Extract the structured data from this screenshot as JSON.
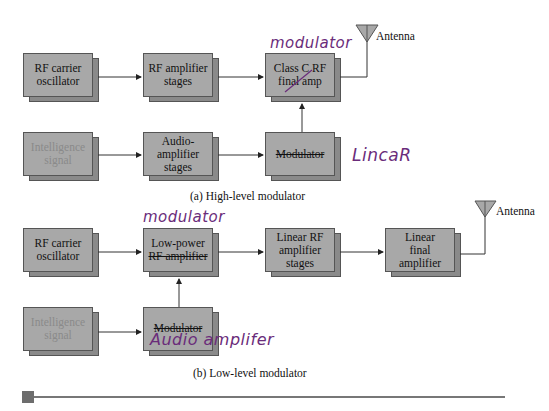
{
  "diagram_a": {
    "caption": "(a) High-level modulator",
    "blocks": [
      {
        "id": "rf_carrier_oscillator",
        "line1": "RF carrier",
        "line2": "oscillator"
      },
      {
        "id": "rf_amplifier_stages",
        "line1": "RF amplifier",
        "line2": "stages"
      },
      {
        "id": "class_c_final_amp",
        "line1": "Class C RF",
        "line2": "final amp",
        "struck": true
      },
      {
        "id": "intelligence_signal",
        "line1": "Intelligence",
        "line2": "signal",
        "faded": true
      },
      {
        "id": "audio_amplifier_stages",
        "line1": "Audio-",
        "line2": "amplifier",
        "line3": "stages"
      },
      {
        "id": "modulator",
        "line1": "Modulator",
        "struck": true
      }
    ],
    "antenna_label": "Antenna",
    "handwritten": {
      "above_final_amp": "modulator",
      "beside_modulator": "LincaR"
    }
  },
  "diagram_b": {
    "caption": "(b) Low-level modulator",
    "blocks": [
      {
        "id": "rf_carrier_oscillator",
        "line1": "RF carrier",
        "line2": "oscillator"
      },
      {
        "id": "low_power_rf_amplifier",
        "line1": "Low-power",
        "line2": "RF amplifier",
        "struck": true
      },
      {
        "id": "linear_rf_amplifier_stages",
        "line1": "Linear RF",
        "line2": "amplifier",
        "line3": "stages"
      },
      {
        "id": "linear_final_amplifier",
        "line1": "Linear",
        "line2": "final",
        "line3": "amplifier"
      },
      {
        "id": "intelligence_signal",
        "line1": "Intelligence",
        "line2": "signal",
        "faded": true
      },
      {
        "id": "modulator",
        "line1": "Modulator",
        "struck": true
      }
    ],
    "antenna_label": "Antenna",
    "handwritten": {
      "above_low_power": "modulator",
      "below_modulator": "Audio amplifer"
    }
  }
}
